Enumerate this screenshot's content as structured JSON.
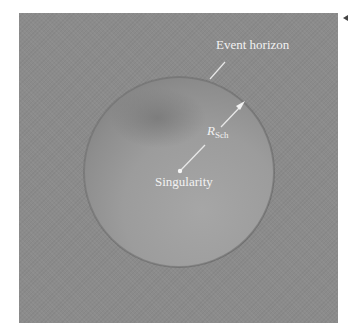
{
  "figure": {
    "labels": {
      "event_horizon": "Event horizon",
      "radius_symbol": "R",
      "radius_subscript": "Sch",
      "singularity": "Singularity"
    },
    "colors": {
      "background_panel": "#8b8b8b",
      "sphere_light": "#a3a3a3",
      "sphere_dark": "#767676",
      "label_text": "#f2f2f2"
    },
    "geometry": {
      "sphere_center": [
        179,
        172
      ],
      "sphere_radius": 95,
      "singularity_point": [
        180,
        171
      ],
      "radius_arrow_tip": [
        245,
        101
      ]
    }
  }
}
